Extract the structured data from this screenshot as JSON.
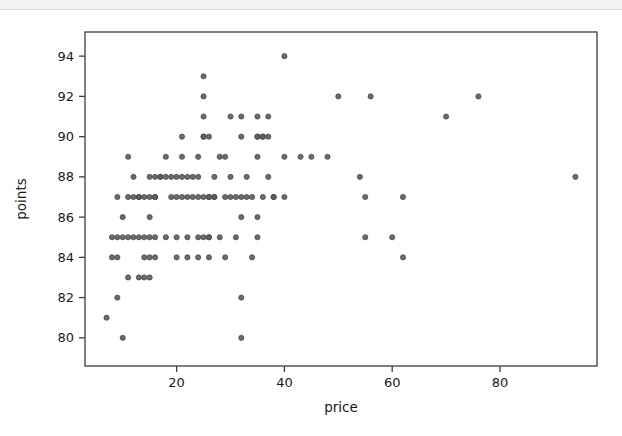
{
  "figure": {
    "background_color": "#ffffff",
    "frame_color": "#3d3d3d",
    "tick_color": "#3d3d3d",
    "text_color": "#1a1a1a"
  },
  "chart_data": {
    "type": "scatter",
    "title": "",
    "xlabel": "price",
    "ylabel": "points",
    "xlim": [
      3,
      98
    ],
    "ylim": [
      78.6,
      95.2
    ],
    "xticks": [
      20,
      40,
      60,
      80
    ],
    "yticks": [
      80,
      82,
      84,
      86,
      88,
      90,
      92,
      94
    ],
    "xtick_labels": [
      "20",
      "40",
      "60",
      "80"
    ],
    "ytick_labels": [
      "80",
      "82",
      "84",
      "86",
      "88",
      "90",
      "92",
      "94"
    ],
    "grid": false,
    "legend": null,
    "marker": {
      "shape": "circle",
      "color": "#5e5e5e",
      "edge_color": "#434343",
      "size_px": 5.2,
      "opacity": 0.92
    },
    "n_points": 132,
    "x": [
      40,
      25,
      25,
      25,
      32,
      35,
      37,
      21,
      25,
      26,
      32,
      35,
      36,
      37,
      11,
      18,
      21,
      24,
      28,
      29,
      35,
      40,
      45,
      48,
      15,
      16,
      17,
      18,
      19,
      20,
      22,
      23,
      11,
      13,
      14,
      15,
      16,
      20,
      21,
      22,
      24,
      25,
      26,
      27,
      29,
      30,
      32,
      34,
      38,
      40,
      55,
      62,
      10,
      15,
      32,
      35,
      8,
      9,
      10,
      11,
      12,
      14,
      15,
      16,
      20,
      24,
      25,
      26,
      35,
      55,
      60,
      8,
      9,
      14,
      15,
      16,
      20,
      22,
      62,
      11,
      13,
      14,
      15,
      9,
      32,
      7,
      10,
      32,
      50,
      56,
      76,
      54,
      94,
      25,
      35,
      36,
      9,
      12,
      13,
      16,
      19,
      23,
      26,
      27,
      31,
      33,
      36,
      38,
      12,
      17,
      21,
      24,
      27,
      30,
      33,
      37,
      13,
      18,
      22,
      26,
      28,
      31,
      24,
      26,
      29,
      34,
      30,
      70,
      43
    ],
    "y": [
      94,
      93,
      92,
      91,
      91,
      91,
      91,
      90,
      90,
      90,
      90,
      90,
      90,
      90,
      89,
      89,
      89,
      89,
      89,
      89,
      89,
      89,
      89,
      89,
      88,
      88,
      88,
      88,
      88,
      88,
      88,
      88,
      87,
      87,
      87,
      87,
      87,
      87,
      87,
      87,
      87,
      87,
      87,
      87,
      87,
      87,
      87,
      87,
      87,
      87,
      87,
      87,
      86,
      86,
      86,
      86,
      85,
      85,
      85,
      85,
      85,
      85,
      85,
      85,
      85,
      85,
      85,
      85,
      85,
      85,
      85,
      84,
      84,
      84,
      84,
      84,
      84,
      84,
      84,
      83,
      83,
      83,
      83,
      82,
      82,
      81,
      80,
      80,
      92,
      92,
      92,
      88,
      88,
      90,
      90,
      90,
      87,
      87,
      87,
      87,
      87,
      87,
      87,
      87,
      87,
      87,
      87,
      87,
      88,
      88,
      88,
      88,
      88,
      88,
      88,
      88,
      85,
      85,
      85,
      85,
      85,
      85,
      84,
      84,
      84,
      84,
      91,
      91,
      89
    ]
  }
}
